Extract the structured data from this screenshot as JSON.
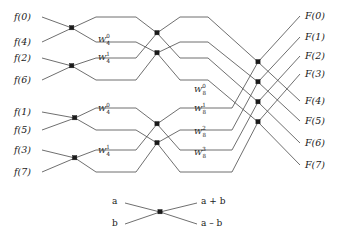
{
  "figure": {
    "line_color": "#4a4a4a",
    "node_color": "#1a1a1a",
    "background": "#ffffff"
  },
  "inputs": [
    {
      "label": "f(0)",
      "y": 17
    },
    {
      "label": "f(4)",
      "y": 42
    },
    {
      "label": "f(2)",
      "y": 58
    },
    {
      "label": "f(6)",
      "y": 80
    },
    {
      "label": "f(1)",
      "y": 112
    },
    {
      "label": "f(5)",
      "y": 130
    },
    {
      "label": "f(3)",
      "y": 150
    },
    {
      "label": "f(7)",
      "y": 172
    }
  ],
  "outputs": [
    {
      "label": "F(0)",
      "y": 16
    },
    {
      "label": "F(1)",
      "y": 37
    },
    {
      "label": "F(2)",
      "y": 56
    },
    {
      "label": "F(3)",
      "y": 74
    },
    {
      "label": "F(4)",
      "y": 101
    },
    {
      "label": "F(5)",
      "y": 121
    },
    {
      "label": "F(6)",
      "y": 143
    },
    {
      "label": "F(7)",
      "y": 165
    }
  ],
  "twiddles_stage2": [
    {
      "base": "W",
      "sup": "0",
      "sub": "4",
      "x": 98,
      "y": 41
    },
    {
      "base": "W",
      "sup": "1",
      "sub": "4",
      "x": 98,
      "y": 59
    },
    {
      "base": "W",
      "sup": "0",
      "sub": "4",
      "x": 98,
      "y": 110
    },
    {
      "base": "W",
      "sup": "1",
      "sub": "4",
      "x": 98,
      "y": 152
    }
  ],
  "twiddles_stage3": [
    {
      "base": "W",
      "sup": "0",
      "sub": "8",
      "x": 194,
      "y": 91
    },
    {
      "base": "W",
      "sup": "1",
      "sub": "8",
      "x": 194,
      "y": 110
    },
    {
      "base": "W",
      "sup": "2",
      "sub": "8",
      "x": 194,
      "y": 133
    },
    {
      "base": "W",
      "sup": "3",
      "sub": "8",
      "x": 194,
      "y": 154
    }
  ],
  "legend": {
    "input_a": "a",
    "input_b": "b",
    "output_sum": "a + b",
    "output_diff": "a – b"
  }
}
